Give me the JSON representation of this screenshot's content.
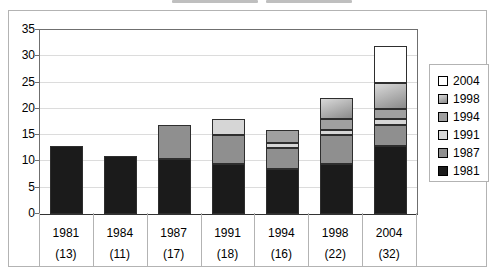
{
  "chart_data": {
    "type": "bar",
    "stacked": true,
    "categories": [
      "1981",
      "1984",
      "1987",
      "1991",
      "1994",
      "1998",
      "2004"
    ],
    "category_counts": [
      "(13)",
      "(11)",
      "(17)",
      "(18)",
      "(16)",
      "(22)",
      "(32)"
    ],
    "totals": [
      13,
      11,
      17,
      18,
      16,
      22,
      32
    ],
    "series": [
      {
        "name": "1981",
        "color": "#1b1b1b",
        "values": [
          13,
          11,
          10.5,
          9.5,
          8.5,
          9.5,
          13
        ]
      },
      {
        "name": "1987",
        "color": "#8f8f8f",
        "values": [
          0,
          0,
          6.5,
          5.5,
          4,
          5.5,
          4
        ]
      },
      {
        "name": "1991",
        "color": "#d6d6d6",
        "values": [
          0,
          0,
          0,
          3,
          1,
          1,
          1
        ]
      },
      {
        "name": "1994",
        "color": "#a0a0a0",
        "values": [
          0,
          0,
          0,
          0,
          2.5,
          2,
          2
        ]
      },
      {
        "name": "1998",
        "color": "#8a8a8a",
        "color_light": "#d9d9d9",
        "gradient": true,
        "values": [
          0,
          0,
          0,
          0,
          0,
          4,
          5
        ]
      },
      {
        "name": "2004",
        "color": "#ffffff",
        "values": [
          0,
          0,
          0,
          0,
          0,
          0,
          7
        ]
      }
    ],
    "ylim": [
      0,
      35
    ],
    "ytick_step": 5,
    "ytick_labels": [
      "0",
      "5",
      "10",
      "15",
      "20",
      "25",
      "30",
      "35"
    ],
    "grid": true,
    "legend": {
      "position": "right",
      "entries_top_to_bottom": [
        "2004",
        "1998",
        "1994",
        "1991",
        "1987",
        "1981"
      ]
    },
    "colors": {
      "plot_border": "#6f6f6f",
      "gridline": "#dcdcdc",
      "bar_border": "#2e2e2e",
      "frame_border": "#b3b3b3"
    }
  }
}
